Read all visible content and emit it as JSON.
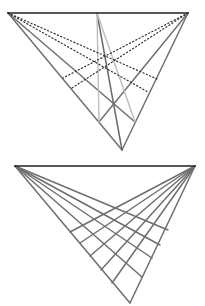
{
  "figures": [
    {
      "name": "perspective-construction-top",
      "top_line": {
        "x1": 8,
        "y1": 13,
        "x2": 188,
        "y2": 13,
        "color": "#222222",
        "width": 1.6
      },
      "segments": [
        {
          "x1": 8,
          "y1": 13,
          "x2": 122,
          "y2": 150,
          "color": "#707070",
          "width": 1.5,
          "style": "solid"
        },
        {
          "x1": 188,
          "y1": 13,
          "x2": 122,
          "y2": 150,
          "color": "#707070",
          "width": 1.5,
          "style": "solid"
        },
        {
          "x1": 8,
          "y1": 13,
          "x2": 135,
          "y2": 122,
          "color": "#707070",
          "width": 1.5,
          "style": "solid"
        },
        {
          "x1": 188,
          "y1": 13,
          "x2": 99,
          "y2": 122,
          "color": "#707070",
          "width": 1.5,
          "style": "solid"
        },
        {
          "x1": 97,
          "y1": 13,
          "x2": 122,
          "y2": 150,
          "color": "#6a6a6a",
          "width": 1.5,
          "style": "solid"
        },
        {
          "x1": 97,
          "y1": 13,
          "x2": 99,
          "y2": 122,
          "color": "#bdbdbd",
          "width": 1.4,
          "style": "solid"
        },
        {
          "x1": 97,
          "y1": 13,
          "x2": 135,
          "y2": 122,
          "color": "#bdbdbd",
          "width": 1.4,
          "style": "solid"
        },
        {
          "x1": 8,
          "y1": 13,
          "x2": 157,
          "y2": 79,
          "color": "#333333",
          "width": 1.2,
          "style": "dotted"
        },
        {
          "x1": 8,
          "y1": 13,
          "x2": 148,
          "y2": 92,
          "color": "#333333",
          "width": 1.2,
          "style": "dotted"
        },
        {
          "x1": 188,
          "y1": 13,
          "x2": 63,
          "y2": 78,
          "color": "#333333",
          "width": 1.2,
          "style": "dotted"
        },
        {
          "x1": 188,
          "y1": 13,
          "x2": 72,
          "y2": 88,
          "color": "#333333",
          "width": 1.2,
          "style": "dotted"
        }
      ]
    },
    {
      "name": "perspective-grid-bottom",
      "top_line": {
        "x1": 15,
        "y1": 166,
        "x2": 195,
        "y2": 166,
        "color": "#222222",
        "width": 1.6
      },
      "left_vertex": {
        "x": 15,
        "y": 166
      },
      "right_vertex": {
        "x": 195,
        "y": 166
      },
      "apex": {
        "x": 130,
        "y": 303
      },
      "line_color": "#6e6e6e",
      "line_width": 1.5,
      "left_fan_ends": [
        {
          "x": 168,
          "y": 230
        },
        {
          "x": 160,
          "y": 245
        },
        {
          "x": 152,
          "y": 258
        },
        {
          "x": 142,
          "y": 277
        },
        {
          "x": 130,
          "y": 303
        }
      ],
      "right_fan_ends": [
        {
          "x": 70,
          "y": 232
        },
        {
          "x": 80,
          "y": 243
        },
        {
          "x": 90,
          "y": 256
        },
        {
          "x": 101,
          "y": 270
        },
        {
          "x": 112,
          "y": 283
        },
        {
          "x": 130,
          "y": 303
        }
      ]
    }
  ]
}
